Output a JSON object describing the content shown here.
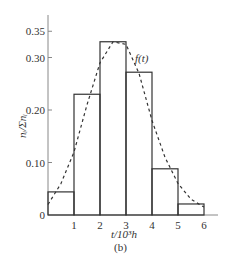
{
  "chart_data": {
    "type": "bar",
    "subtype": "histogram-with-density-curve",
    "title": "",
    "caption": "(b)",
    "xlabel": "t/10³h",
    "ylabel": "nᵢ/Σnᵢ",
    "x_ticks": [
      "1",
      "2",
      "3",
      "4",
      "5",
      "6"
    ],
    "y_ticks": [
      "0",
      "0.10",
      "0.20",
      "0.30",
      "0.35"
    ],
    "y_tick_values": [
      0,
      0.1,
      0.2,
      0.3,
      0.35
    ],
    "xlim": [
      0,
      6.8
    ],
    "ylim": [
      0,
      0.37
    ],
    "grid": false,
    "bins": [
      [
        0,
        1
      ],
      [
        1,
        2
      ],
      [
        2,
        3
      ],
      [
        3,
        4
      ],
      [
        4,
        5
      ],
      [
        5,
        6
      ]
    ],
    "categories": [
      "0-1",
      "1-2",
      "2-3",
      "3-4",
      "4-5",
      "5-6"
    ],
    "values": [
      0.044,
      0.23,
      0.33,
      0.272,
      0.088,
      0.021
    ],
    "series": [
      {
        "name": "histogram",
        "style": "solid-outline",
        "values": [
          0.044,
          0.23,
          0.33,
          0.272,
          0.088,
          0.021
        ]
      },
      {
        "name": "f(t)",
        "style": "dashed",
        "x": [
          0,
          0.5,
          1,
          1.5,
          2,
          2.5,
          3,
          3.5,
          4,
          4.5,
          5,
          5.5,
          6
        ],
        "values": [
          0.02,
          0.06,
          0.12,
          0.21,
          0.29,
          0.33,
          0.325,
          0.27,
          0.18,
          0.11,
          0.06,
          0.03,
          0.015
        ]
      }
    ],
    "annotations": [
      {
        "text": "f(t)",
        "x": 3.6,
        "y": 0.3
      }
    ]
  },
  "labels": {
    "curve": "f(t)",
    "xlabel": "t/10³h",
    "caption": "(b)",
    "ylabel": "nᵢ/Σnᵢ"
  }
}
